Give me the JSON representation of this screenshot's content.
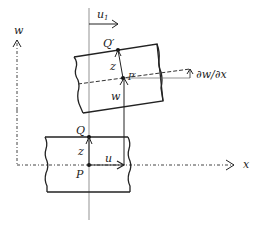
{
  "diagram": {
    "axes": {
      "x_label": "x",
      "w_label": "w"
    },
    "labels": {
      "u1_base": "u",
      "u1_sub": "1",
      "Q_prime": "Q′",
      "P_prime": "P′",
      "z_top": "z",
      "w_disp": "w",
      "slope": "∂w/∂x",
      "Q": "Q",
      "z_bottom": "z",
      "u": "u",
      "P": "P"
    },
    "colors": {
      "stroke": "#222222",
      "guide": "#666666",
      "background": "#ffffff"
    }
  }
}
